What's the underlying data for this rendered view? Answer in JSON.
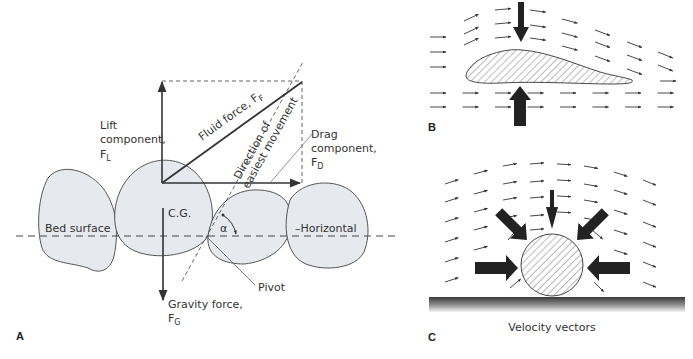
{
  "figure": {
    "panels": {
      "a": {
        "label": "A",
        "lift_label_line1": "Lift",
        "lift_label_line2": "component,",
        "lift_symbol": "F",
        "lift_subscript": "L",
        "fluid_label": "Fluid force, F",
        "fluid_subscript": "F",
        "direction_line1": "Direction of",
        "direction_line2": "easiest movement",
        "drag_label_line1": "Drag",
        "drag_label_line2": "component,",
        "drag_symbol": "F",
        "drag_subscript": "D",
        "cg_label": "C.G.",
        "bed_label": "Bed surface",
        "horizontal_label": "–Horizontal",
        "alpha_label": "α",
        "pivot_label": "Pivot",
        "gravity_label": "Gravity force,",
        "gravity_symbol": "F",
        "gravity_subscript": "G"
      },
      "b": {
        "label": "B"
      },
      "c": {
        "label": "C",
        "caption": "Velocity vectors"
      }
    }
  }
}
